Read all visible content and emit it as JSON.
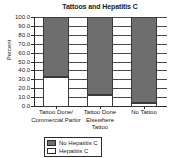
{
  "chart_data": {
    "type": "bar",
    "stacked": true,
    "title": "Tattoos and Hepatitis C",
    "xlabel": "",
    "ylabel": "Percent",
    "ylim": [
      0.0,
      100.0
    ],
    "ytick_step": 10.0,
    "grid": true,
    "legend_position": "bottom",
    "categories": [
      "Tattoo Done/\nCommercial Parlor",
      "Tattoo Done\nElsewhere\nTattoo",
      "No Tattoo"
    ],
    "ytick_labels": [
      "100.0",
      "90.0",
      "80.0",
      "70.0",
      "60.0",
      "50.0",
      "40.0",
      "30.0",
      "20.0",
      "10.0",
      "0.0"
    ],
    "ytick_values": [
      100,
      90,
      80,
      70,
      60,
      50,
      40,
      30,
      20,
      10,
      0
    ],
    "series": [
      {
        "name": "No Hepatitis C",
        "color": "#6e6e6e",
        "values": [
          67.0,
          88.0,
          96.5
        ]
      },
      {
        "name": "Hepatitis C",
        "color": "#ffffff",
        "values": [
          33.0,
          12.0,
          3.5
        ]
      }
    ],
    "legend": [
      {
        "label": "No Hepatitis C",
        "color": "#6e6e6e"
      },
      {
        "label": "Hepatitis C",
        "color": "#ffffff"
      }
    ]
  }
}
